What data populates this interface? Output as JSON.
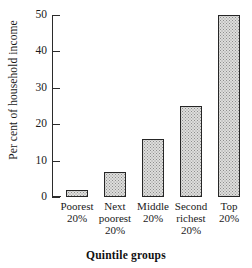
{
  "chart_data": {
    "type": "bar",
    "title": "",
    "xlabel": "Quintile groups",
    "ylabel": "Per cent of household income",
    "categories": [
      "Poorest\n20%",
      "Next\npoorest\n20%",
      "Middle\n20%",
      "Second\nrichest\n20%",
      "Top\n20%"
    ],
    "values": [
      2,
      7,
      16,
      25,
      50
    ],
    "ylim": [
      0,
      50
    ],
    "yticks": [
      0,
      10,
      20,
      30,
      40,
      50
    ],
    "ytick_labels": [
      "0",
      "10",
      "20",
      "30",
      "40",
      "50"
    ],
    "grid": false,
    "legend": false,
    "bar_fill": "#dededc",
    "bar_edge": "#262626",
    "axis_color": "#2b2b2b"
  }
}
